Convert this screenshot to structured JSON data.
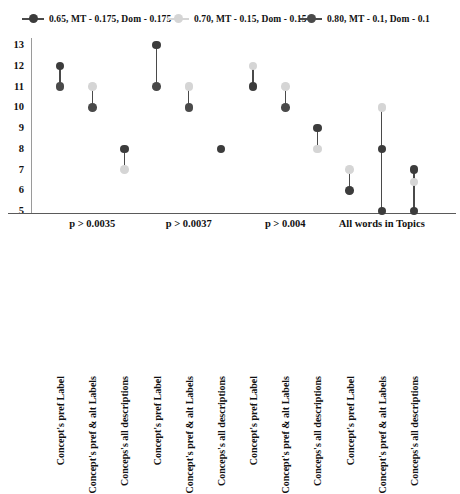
{
  "legend": {
    "items": [
      {
        "label": "0.65, MT - 0.175, Dom - 0.175",
        "color": "#3c3c3c",
        "marker": "legend-dot-dark"
      },
      {
        "label": "0.70, MT - 0.15, Dom - 0.15",
        "color": "#d5d5d5",
        "marker": "legend-dot-light"
      },
      {
        "label": "0.80, MT - 0.1, Dom - 0.1",
        "color": "#4a4a4a",
        "marker": "legend-dot-dark2"
      }
    ]
  },
  "chart_data": {
    "type": "scatter",
    "title": "",
    "xlabel": "",
    "ylabel": "",
    "ylim": [
      5,
      13
    ],
    "yticks": [
      5,
      6,
      7,
      8,
      9,
      10,
      11,
      12,
      13
    ],
    "grid": false,
    "legend_position": "top",
    "line_color": "#4a4a4a",
    "categories": [
      "Concept's pref Label",
      "Concept's pref & alt Labels",
      "Conceps's all descriptions",
      "Concept's pref Label",
      "Concept's pref & alt Labels",
      "Conceps's all descriptions",
      "Concept's pref Label",
      "Concept's pref & alt Labels",
      "Conceps's all descriptions",
      "Concept's pref Label",
      "Concept's pref & alt Labels",
      "Conceps's all descriptions"
    ],
    "groups": [
      {
        "label": "p > 0.0035",
        "start": 0,
        "end": 2
      },
      {
        "label": "p > 0.0037",
        "start": 3,
        "end": 5
      },
      {
        "label": "p > 0.004",
        "start": 6,
        "end": 8
      },
      {
        "label": "All words in Topics",
        "start": 9,
        "end": 11
      }
    ],
    "series": [
      {
        "name": "0.65, MT - 0.175, Dom - 0.175",
        "color": "#3c3c3c",
        "values": [
          12,
          10,
          8,
          13,
          10,
          8,
          11,
          10,
          9,
          6,
          8,
          7
        ]
      },
      {
        "name": "0.70, MT - 0.15, Dom - 0.15",
        "color": "#d5d5d5",
        "values": [
          12,
          11,
          7,
          13,
          11,
          8,
          12,
          11,
          8,
          7,
          10,
          6.4
        ]
      },
      {
        "name": "0.80, MT - 0.1, Dom - 0.1",
        "color": "#4a4a4a",
        "values": [
          11,
          10,
          8,
          11,
          10,
          8,
          11,
          10,
          9,
          6,
          5,
          5
        ]
      }
    ],
    "columns": [
      {
        "index": 0,
        "top": 12,
        "bottom": 11,
        "points": [
          {
            "v": 12,
            "c": "#3c3c3c"
          },
          {
            "v": 11,
            "c": "#4a4a4a"
          }
        ]
      },
      {
        "index": 1,
        "top": 11,
        "bottom": 10,
        "points": [
          {
            "v": 11,
            "c": "#d5d5d5"
          },
          {
            "v": 10,
            "c": "#4a4a4a"
          }
        ]
      },
      {
        "index": 2,
        "top": 8,
        "bottom": 7,
        "points": [
          {
            "v": 8,
            "c": "#3c3c3c"
          },
          {
            "v": 7,
            "c": "#d5d5d5"
          }
        ]
      },
      {
        "index": 3,
        "top": 13,
        "bottom": 11,
        "points": [
          {
            "v": 13,
            "c": "#3c3c3c"
          },
          {
            "v": 11,
            "c": "#4a4a4a"
          }
        ]
      },
      {
        "index": 4,
        "top": 11,
        "bottom": 10,
        "points": [
          {
            "v": 11,
            "c": "#d5d5d5"
          },
          {
            "v": 10,
            "c": "#4a4a4a"
          }
        ]
      },
      {
        "index": 5,
        "top": 8,
        "bottom": 8,
        "points": [
          {
            "v": 8,
            "c": "#3c3c3c"
          }
        ]
      },
      {
        "index": 6,
        "top": 12,
        "bottom": 11,
        "points": [
          {
            "v": 12,
            "c": "#d5d5d5"
          },
          {
            "v": 11,
            "c": "#3c3c3c"
          }
        ]
      },
      {
        "index": 7,
        "top": 11,
        "bottom": 10,
        "points": [
          {
            "v": 11,
            "c": "#d5d5d5"
          },
          {
            "v": 10,
            "c": "#4a4a4a"
          }
        ]
      },
      {
        "index": 8,
        "top": 9,
        "bottom": 8,
        "points": [
          {
            "v": 9,
            "c": "#3c3c3c"
          },
          {
            "v": 8,
            "c": "#d5d5d5"
          }
        ]
      },
      {
        "index": 9,
        "top": 7,
        "bottom": 6,
        "points": [
          {
            "v": 7,
            "c": "#d5d5d5"
          },
          {
            "v": 6,
            "c": "#3c3c3c"
          }
        ]
      },
      {
        "index": 10,
        "top": 10,
        "bottom": 5,
        "points": [
          {
            "v": 10,
            "c": "#d5d5d5"
          },
          {
            "v": 8,
            "c": "#3c3c3c"
          },
          {
            "v": 5,
            "c": "#3c3c3c"
          }
        ]
      },
      {
        "index": 11,
        "top": 7,
        "bottom": 5,
        "points": [
          {
            "v": 7,
            "c": "#3c3c3c"
          },
          {
            "v": 6.4,
            "c": "#d5d5d5"
          },
          {
            "v": 5,
            "c": "#3c3c3c"
          }
        ]
      }
    ]
  }
}
